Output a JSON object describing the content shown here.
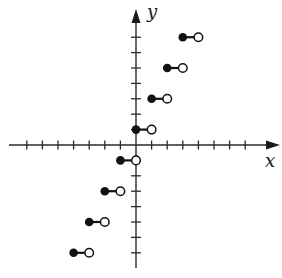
{
  "chart_data": {
    "type": "scatter",
    "title": "",
    "subtitle": "Step function graph (greatest integer style): y = 2⌊x⌋ + 1",
    "xlabel": "x",
    "ylabel": "y",
    "xlim": [
      -8,
      8
    ],
    "ylim": [
      -8,
      8
    ],
    "x_ticks": [
      -7,
      -6,
      -5,
      -4,
      -3,
      -2,
      -1,
      1,
      2,
      3,
      4,
      5,
      6,
      7
    ],
    "y_ticks": [
      -7,
      -6,
      -5,
      -4,
      -3,
      -2,
      -1,
      1,
      2,
      3,
      4,
      5,
      6,
      7
    ],
    "tick_labels_shown": false,
    "grid": false,
    "legend": null,
    "segments": [
      {
        "x_start": -4,
        "x_end": -3,
        "y": -7,
        "closed_left": true,
        "open_right": true
      },
      {
        "x_start": -3,
        "x_end": -2,
        "y": -5,
        "closed_left": true,
        "open_right": true
      },
      {
        "x_start": -2,
        "x_end": -1,
        "y": -3,
        "closed_left": true,
        "open_right": true
      },
      {
        "x_start": -1,
        "x_end": 0,
        "y": -1,
        "closed_left": true,
        "open_right": true
      },
      {
        "x_start": 0,
        "x_end": 1,
        "y": 1,
        "closed_left": true,
        "open_right": true
      },
      {
        "x_start": 1,
        "x_end": 2,
        "y": 3,
        "closed_left": true,
        "open_right": true
      },
      {
        "x_start": 2,
        "x_end": 3,
        "y": 5,
        "closed_left": true,
        "open_right": true
      },
      {
        "x_start": 3,
        "x_end": 4,
        "y": 7,
        "closed_left": true,
        "open_right": true
      }
    ],
    "colors": {
      "axis": "#2a2a2a",
      "dot_fill": "#111111",
      "open_dot_fill": "#ffffff"
    }
  },
  "labels": {
    "x": "x",
    "y": "y"
  }
}
